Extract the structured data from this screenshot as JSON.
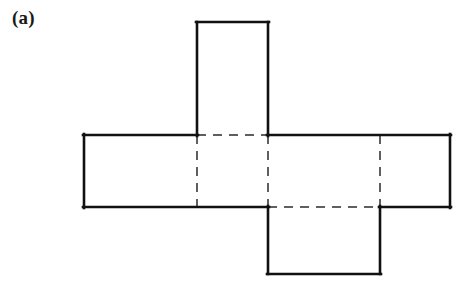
{
  "figure": {
    "label": "(a)",
    "caption_present": true,
    "background_color": "#ffffff",
    "solid_line_color": "#111111",
    "dashed_line_color": "#2b2b2b",
    "width": 459,
    "height": 290
  },
  "diagram": {
    "kind": "box-net",
    "faces": [
      {
        "name": "top-flap",
        "x": 197,
        "y": 22,
        "width": 71,
        "height": 113
      },
      {
        "name": "left-face",
        "x": 84,
        "y": 135,
        "width": 113,
        "height": 72
      },
      {
        "name": "center-face",
        "x": 197,
        "y": 135,
        "width": 71,
        "height": 72
      },
      {
        "name": "middle-right-face",
        "x": 268,
        "y": 135,
        "width": 112,
        "height": 72
      },
      {
        "name": "right-face",
        "x": 380,
        "y": 135,
        "width": 70,
        "height": 72
      },
      {
        "name": "bottom-flap",
        "x": 268,
        "y": 207,
        "width": 112,
        "height": 67
      }
    ],
    "solid_edges": [
      {
        "name": "top-flap-left",
        "x1": 197,
        "y1": 22,
        "x2": 197,
        "y2": 135
      },
      {
        "name": "top-flap-top",
        "x1": 197,
        "y1": 22,
        "x2": 268,
        "y2": 22
      },
      {
        "name": "top-flap-right",
        "x1": 268,
        "y1": 22,
        "x2": 268,
        "y2": 135
      },
      {
        "name": "band-top-left-segment",
        "x1": 84,
        "y1": 135,
        "x2": 197,
        "y2": 135
      },
      {
        "name": "band-top-right-segment",
        "x1": 268,
        "y1": 135,
        "x2": 450,
        "y2": 135
      },
      {
        "name": "band-left",
        "x1": 84,
        "y1": 135,
        "x2": 84,
        "y2": 207
      },
      {
        "name": "band-right",
        "x1": 450,
        "y1": 135,
        "x2": 450,
        "y2": 207
      },
      {
        "name": "band-bottom-left-segment",
        "x1": 84,
        "y1": 207,
        "x2": 268,
        "y2": 207
      },
      {
        "name": "band-bottom-right-segment",
        "x1": 380,
        "y1": 207,
        "x2": 450,
        "y2": 207
      },
      {
        "name": "bottom-flap-left",
        "x1": 268,
        "y1": 207,
        "x2": 268,
        "y2": 274
      },
      {
        "name": "bottom-flap-bottom",
        "x1": 268,
        "y1": 274,
        "x2": 380,
        "y2": 274
      },
      {
        "name": "bottom-flap-right",
        "x1": 380,
        "y1": 207,
        "x2": 380,
        "y2": 274
      }
    ],
    "dashed_edges": [
      {
        "name": "fold-top-center",
        "x1": 197,
        "y1": 135,
        "x2": 268,
        "y2": 135
      },
      {
        "name": "fold-bottom-center",
        "x1": 268,
        "y1": 207,
        "x2": 380,
        "y2": 207
      },
      {
        "name": "fold-vertical-left",
        "x1": 197,
        "y1": 135,
        "x2": 197,
        "y2": 207
      },
      {
        "name": "fold-vertical-middle",
        "x1": 268,
        "y1": 135,
        "x2": 268,
        "y2": 207
      },
      {
        "name": "fold-vertical-right",
        "x1": 380,
        "y1": 135,
        "x2": 380,
        "y2": 207
      }
    ]
  }
}
